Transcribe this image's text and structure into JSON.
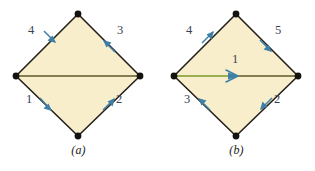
{
  "figure": {
    "background_color": "#ffffff",
    "fill_color": "#f9eecc",
    "edge_color": "#24201c",
    "diagonal_color_a": "#5d5a2a",
    "diagonal_color_b": "#7a9a28",
    "arrow_color": "#3f7fa6",
    "label_color": "#3a3f52",
    "vertex_color": "#15130f"
  },
  "panels": [
    {
      "id": "a",
      "caption": "(a)",
      "shape": "diamond",
      "vertices": [
        {
          "name": "top",
          "x": 78,
          "y": 14
        },
        {
          "name": "right",
          "x": 140,
          "y": 76
        },
        {
          "name": "bottom",
          "x": 78,
          "y": 136
        },
        {
          "name": "left",
          "x": 16,
          "y": 76
        }
      ],
      "diagonal": {
        "from": "left",
        "to": "right",
        "arrow": false,
        "color": "#5d5a2a"
      },
      "edges": [
        {
          "label": "1",
          "from": "left",
          "to": "bottom",
          "arrow_direction": "down-right",
          "label_x": 29,
          "label_y": 99
        },
        {
          "label": "2",
          "from": "bottom",
          "to": "right",
          "arrow_direction": "up-right",
          "label_x": 115,
          "label_y": 99
        },
        {
          "label": "3",
          "from": "right",
          "to": "top",
          "arrow_direction": "up-left",
          "label_x": 114,
          "label_y": 29
        },
        {
          "label": "4",
          "from": "top",
          "to": "left",
          "arrow_direction": "down-left",
          "label_x": 30,
          "label_y": 29
        }
      ]
    },
    {
      "id": "b",
      "caption": "(b)",
      "shape": "diamond",
      "vertices": [
        {
          "name": "top",
          "x": 78,
          "y": 14
        },
        {
          "name": "right",
          "x": 140,
          "y": 76
        },
        {
          "name": "bottom",
          "x": 78,
          "y": 136
        },
        {
          "name": "left",
          "x": 16,
          "y": 76
        }
      ],
      "diagonal": {
        "from": "left",
        "to": "right",
        "arrow": true,
        "arrow_direction": "right",
        "color": "#7a9a28",
        "label": "1",
        "label_x": 75,
        "label_y": 58
      },
      "edges": [
        {
          "label": "2",
          "from": "right",
          "to": "bottom",
          "arrow_direction": "down-left",
          "label_x": 115,
          "label_y": 99
        },
        {
          "label": "3",
          "from": "bottom",
          "to": "left",
          "arrow_direction": "up-left",
          "label_x": 29,
          "label_y": 99
        },
        {
          "label": "4",
          "from": "left",
          "to": "top",
          "arrow_direction": "up-right",
          "label_x": 30,
          "label_y": 29
        },
        {
          "label": "5",
          "from": "top",
          "to": "right",
          "arrow_direction": "down-right",
          "label_x": 114,
          "label_y": 29
        }
      ]
    }
  ]
}
